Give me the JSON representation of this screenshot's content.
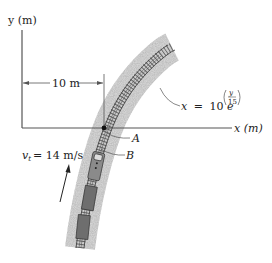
{
  "figure": {
    "y_axis_label": "y (m)",
    "x_axis_label": "x (m)",
    "dimension_label": "10 m",
    "curve_equation": {
      "lhs": "x",
      "equals": "=",
      "coefficient": "10",
      "base": "e",
      "exp_numerator": "y",
      "exp_denominator": "15"
    },
    "point_a_label": "A",
    "point_b_label": "B",
    "velocity": {
      "symbol": "v",
      "subscript": "t",
      "equals": "= 14 m/s"
    },
    "colors": {
      "axis": "#555555",
      "text": "#222222",
      "gravel": "#b8b8b8",
      "track": "#444444",
      "train": "#6e6e6e"
    }
  }
}
